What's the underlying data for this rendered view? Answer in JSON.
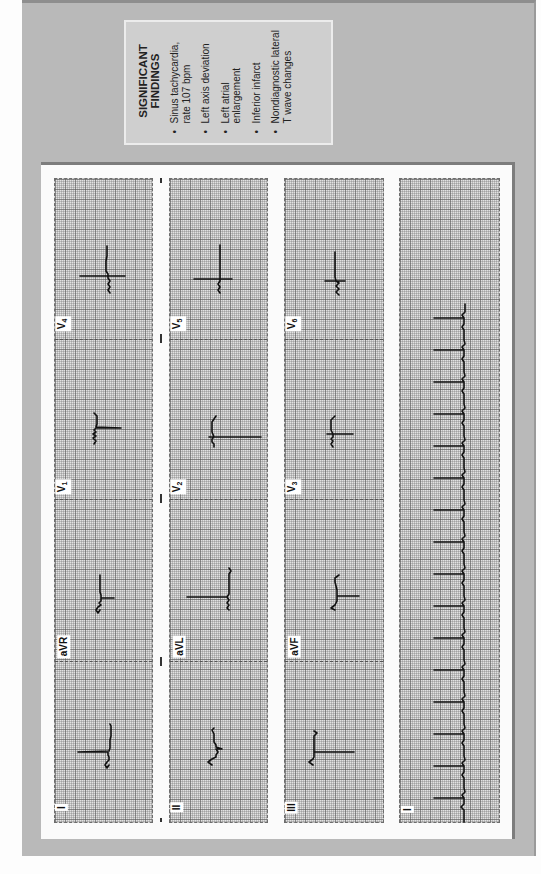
{
  "findings": {
    "title_line1": "SIGNIFICANT",
    "title_line2": "FINDINGS",
    "items": [
      {
        "line1": "Sinus tachycardia,",
        "line2": "rate 107 bpm"
      },
      {
        "line1": "Left axis deviation",
        "line2": ""
      },
      {
        "line1": "Left atrial",
        "line2": "enlargement"
      },
      {
        "line1": "Inferior infarct",
        "line2": ""
      },
      {
        "line1": "Nondiagnostic lateral",
        "line2": "T wave changes"
      }
    ],
    "bullet": "•"
  },
  "ecg": {
    "columns": [
      {
        "leads": [
          {
            "name": "I",
            "sub": ""
          },
          {
            "name": "aVR",
            "sub": ""
          },
          {
            "name": "V",
            "sub": "1"
          },
          {
            "name": "V",
            "sub": "4"
          }
        ]
      },
      {
        "leads": [
          {
            "name": "II",
            "sub": ""
          },
          {
            "name": "aVL",
            "sub": ""
          },
          {
            "name": "V",
            "sub": "2"
          },
          {
            "name": "V",
            "sub": "5"
          }
        ]
      },
      {
        "leads": [
          {
            "name": "III",
            "sub": ""
          },
          {
            "name": "aVF",
            "sub": ""
          },
          {
            "name": "V",
            "sub": "3"
          },
          {
            "name": "V",
            "sub": "6"
          }
        ]
      }
    ],
    "rhythm_strip": {
      "name": "I",
      "sub": ""
    },
    "heart_rate_bpm": 107,
    "colors": {
      "grid_bg": "#e2e2e2",
      "grid_line": "#5a5a5a",
      "trace": "#111111",
      "page_bg": "#b9b9b9",
      "findings_bg": "#cfcfcf"
    }
  }
}
